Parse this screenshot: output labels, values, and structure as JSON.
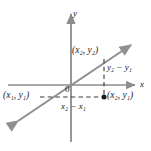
{
  "figure": {
    "kind": "coordinate-plane-slope-diagram",
    "width": 151,
    "height": 151,
    "background_color": "#ffffff"
  },
  "axes": {
    "x_label": "x",
    "y_label": "y",
    "origin_label": "0",
    "axis_color": "#8c8c8c",
    "x_axis": {
      "y_px": 85,
      "x_start_px": 8,
      "x_end_px": 137,
      "arrow": "right"
    },
    "y_axis": {
      "x_px": 71,
      "y_start_px": 142,
      "y_end_px": 12,
      "arrow": "up"
    }
  },
  "line": {
    "color": "#8f8f8f",
    "from_px": {
      "x": 16,
      "y": 122
    },
    "to_px": {
      "x": 133,
      "y": 43
    },
    "arrows": "both"
  },
  "points": [
    {
      "id": "point-1",
      "label": "(x₁, y₁)",
      "x_text": "x",
      "x_sub": "1",
      "y_text": "y",
      "y_sub": "1",
      "label_pos_px": {
        "x": 4,
        "y": 92
      },
      "marker": false
    },
    {
      "id": "point-2",
      "label": "(x₂, y₂)",
      "x_text": "x",
      "x_sub": "2",
      "y_text": "y",
      "y_sub": "2",
      "label_pos_px": {
        "x": 73,
        "y": 47
      },
      "marker": false
    },
    {
      "id": "point-corner",
      "label": "(x₂, y₁)",
      "x_text": "x",
      "x_sub": "2",
      "y_text": "y",
      "y_sub": "1",
      "label_pos_px": {
        "x": 108,
        "y": 92
      },
      "marker": true,
      "marker_px": {
        "x": 104,
        "y": 97
      },
      "marker_color": "#1a1a1a"
    }
  ],
  "dashed_lines": {
    "color": "#3a3a3a",
    "horizontal": {
      "y_px": 97,
      "x_start_px": 40,
      "x_end_px": 104
    },
    "vertical": {
      "x_px": 104,
      "y_start_px": 59,
      "y_end_px": 97
    }
  },
  "measure_labels": {
    "run": {
      "text": "x₂ − x₁",
      "pos_px": {
        "x": 62,
        "y": 103
      }
    },
    "rise": {
      "text": "y₂ − y₁",
      "pos_px": {
        "x": 107,
        "y": 64
      }
    }
  },
  "colors": {
    "axis": "#8c8c8c",
    "line": "#8f8f8f",
    "dash": "#3a3a3a",
    "text": "#1a1a1a"
  }
}
